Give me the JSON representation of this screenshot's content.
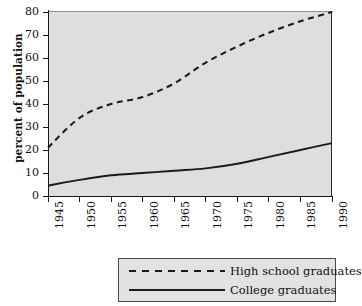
{
  "chart_data": {
    "type": "line",
    "title": "",
    "xlabel": "",
    "ylabel": "percent of population",
    "xlim": [
      1945,
      1990
    ],
    "ylim": [
      0,
      80
    ],
    "grid": false,
    "legend_position": "bottom",
    "x_ticks": [
      "1945",
      "1950",
      "1955",
      "1960",
      "1965",
      "1970",
      "1975",
      "1980",
      "1985",
      "1990"
    ],
    "y_ticks": [
      "0",
      "10",
      "20",
      "30",
      "40",
      "50",
      "60",
      "70",
      "80"
    ],
    "x": [
      1945,
      1950,
      1955,
      1960,
      1965,
      1970,
      1975,
      1980,
      1985,
      1990
    ],
    "series": [
      {
        "name": "High school graduates",
        "style": "dashed",
        "color": "#1a1a1a",
        "values": [
          21,
          34,
          40,
          43,
          49,
          58,
          65,
          71,
          76,
          80
        ]
      },
      {
        "name": "College graduates",
        "style": "solid",
        "color": "#1a1a1a",
        "values": [
          4.5,
          7,
          9,
          10,
          11,
          12,
          14,
          17,
          20,
          23
        ]
      }
    ],
    "plot_background": "#dedede",
    "page_background": "#ffffff"
  },
  "legend": {
    "entries": [
      {
        "label": "High school graduates",
        "style": "dashed"
      },
      {
        "label": "College graduates",
        "style": "solid"
      }
    ]
  }
}
